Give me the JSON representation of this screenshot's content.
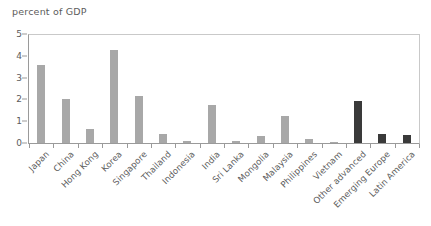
{
  "chart_data": {
    "type": "bar",
    "title": "percent of GDP",
    "xlabel": "",
    "ylabel": "",
    "ylim": [
      0,
      5
    ],
    "yticks": [
      0,
      1,
      2,
      3,
      4,
      5
    ],
    "grid": false,
    "legend": "none",
    "categories": [
      "Japan",
      "China",
      "Hong Kong",
      "Korea",
      "Singapore",
      "Thailand",
      "Indonesia",
      "India",
      "Sri Lanka",
      "Mongolia",
      "Malaysia",
      "Philippines",
      "Vietnam",
      "Other advanced",
      "Emerging Europe",
      "Latin America"
    ],
    "values": [
      3.6,
      2.0,
      0.65,
      4.25,
      2.15,
      0.4,
      0.08,
      1.75,
      0.1,
      0.3,
      1.25,
      0.2,
      0.05,
      1.95,
      0.4,
      0.35
    ],
    "series": [
      {
        "name": "percent of GDP",
        "values": [
          3.6,
          2.0,
          0.65,
          4.25,
          2.15,
          0.4,
          0.08,
          1.75,
          0.1,
          0.3,
          1.25,
          0.2,
          0.05,
          1.95,
          0.4,
          0.35
        ]
      }
    ],
    "bar_colors": [
      "#a8a8a8",
      "#a8a8a8",
      "#a8a8a8",
      "#a8a8a8",
      "#a8a8a8",
      "#a8a8a8",
      "#a8a8a8",
      "#a8a8a8",
      "#a8a8a8",
      "#a8a8a8",
      "#a8a8a8",
      "#a8a8a8",
      "#a8a8a8",
      "#3a3a3a",
      "#3a3a3a",
      "#3a3a3a"
    ],
    "colors": {
      "bar_light": "#a8a8a8",
      "bar_dark": "#3a3a3a",
      "axis": "#9a9a9a",
      "frame": "#c9c9c9",
      "text": "#5c5c5c",
      "background": "#ffffff"
    }
  }
}
